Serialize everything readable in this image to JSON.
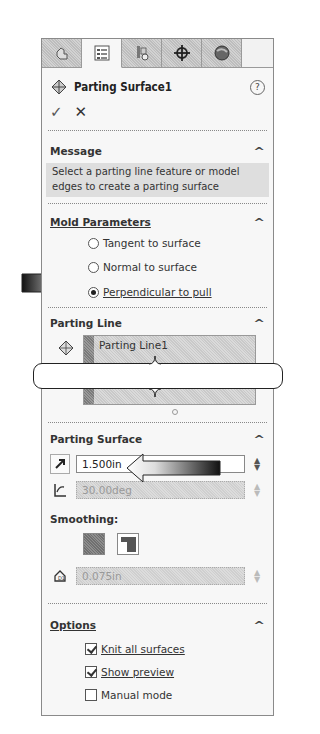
{
  "tabs": [
    {
      "name": "feature-manager",
      "icon": "part-tree-icon",
      "active": false
    },
    {
      "name": "property-manager",
      "icon": "property-list-icon",
      "active": true
    },
    {
      "name": "configuration-manager",
      "icon": "configuration-icon",
      "active": false
    },
    {
      "name": "dim-xpert-manager",
      "icon": "crosshair-icon",
      "active": false
    },
    {
      "name": "display-manager",
      "icon": "appearance-sphere-icon",
      "active": false
    }
  ],
  "header": {
    "title": "Parting Surface1",
    "help_glyph": "?",
    "ok_glyph": "✓",
    "cancel_glyph": "✕"
  },
  "message": {
    "heading": "Message",
    "text": "Select a parting line feature or model edges to create a parting surface"
  },
  "mold_parameters": {
    "heading": "Mold Parameters",
    "options": [
      {
        "label": "Tangent to surface",
        "selected": false
      },
      {
        "label": "Normal to surface",
        "selected": false
      },
      {
        "label": "Perpendicular to pull",
        "selected": true
      }
    ]
  },
  "parting_line": {
    "heading": "Parting Line",
    "items": [
      "Parting Line1"
    ]
  },
  "parting_surface": {
    "heading": "Parting Surface",
    "distance": "1.500in",
    "angle": "30.00deg",
    "smoothing_label": "Smoothing:",
    "smoothing_distance": "0.075in"
  },
  "options": {
    "heading": "Options",
    "checkboxes": [
      {
        "label": "Knit all surfaces",
        "checked": true
      },
      {
        "label": "Show preview",
        "checked": true
      },
      {
        "label": "Manual mode",
        "checked": false
      }
    ]
  },
  "caret_glyph": "^"
}
